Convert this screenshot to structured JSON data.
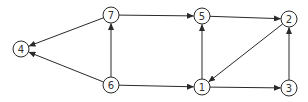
{
  "diagram": {
    "type": "directed-graph",
    "nodes": [
      {
        "id": "4",
        "label": "4",
        "x": 21,
        "y": 49
      },
      {
        "id": "7",
        "label": "7",
        "x": 111,
        "y": 15
      },
      {
        "id": "6",
        "label": "6",
        "x": 111,
        "y": 85
      },
      {
        "id": "5",
        "label": "5",
        "x": 202,
        "y": 16
      },
      {
        "id": "1",
        "label": "1",
        "x": 202,
        "y": 87
      },
      {
        "id": "2",
        "label": "2",
        "x": 289,
        "y": 19
      },
      {
        "id": "3",
        "label": "3",
        "x": 289,
        "y": 88
      }
    ],
    "edges": [
      {
        "from": "7",
        "to": "4"
      },
      {
        "from": "6",
        "to": "4"
      },
      {
        "from": "6",
        "to": "7"
      },
      {
        "from": "7",
        "to": "5"
      },
      {
        "from": "6",
        "to": "1"
      },
      {
        "from": "1",
        "to": "5"
      },
      {
        "from": "5",
        "to": "2"
      },
      {
        "from": "2",
        "to": "1"
      },
      {
        "from": "1",
        "to": "3"
      },
      {
        "from": "3",
        "to": "2"
      }
    ],
    "node_radius": 8,
    "colors": {
      "stroke": "#2a2a2a",
      "fill": "#ffffff",
      "text": "#333333"
    }
  }
}
